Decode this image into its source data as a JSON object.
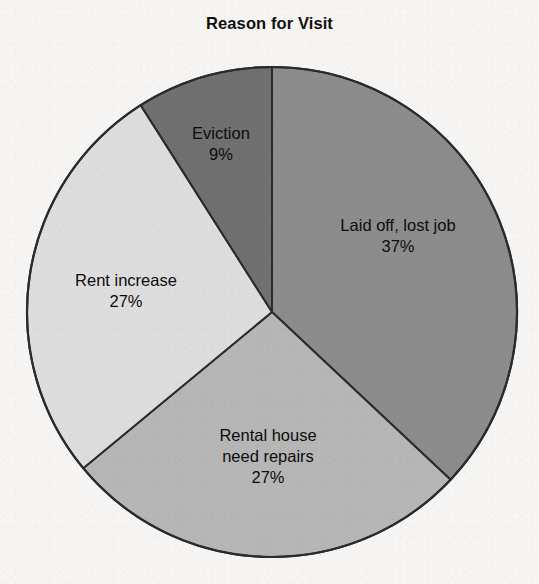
{
  "chart_data": {
    "type": "pie",
    "title": "Reason for Visit",
    "xlabel": "",
    "ylabel": "",
    "legend_position": "none",
    "grid": false,
    "labels_inside": true,
    "value_suffix": "%",
    "categories": [
      "Laid off, lost job",
      "Rental house need repairs",
      "Rent increase",
      "Eviction"
    ],
    "values": [
      37,
      27,
      27,
      9
    ],
    "start_angle_deg": 0,
    "direction": "clockwise",
    "slices": [
      {
        "name": "laid-off-lost-job",
        "label": "Laid off, lost job",
        "label_lines": [
          "Laid off, lost job"
        ],
        "value": 37,
        "value_text": "37%",
        "color": "#8c8c8c",
        "start_deg": 0,
        "end_deg": 133.2
      },
      {
        "name": "rental-house-need-repairs",
        "label": "Rental house need repairs",
        "label_lines": [
          "Rental house",
          "need repairs"
        ],
        "value": 27,
        "value_text": "27%",
        "color": "#b6b6b6",
        "start_deg": 133.2,
        "end_deg": 230.4
      },
      {
        "name": "rent-increase",
        "label": "Rent increase",
        "label_lines": [
          "Rent increase"
        ],
        "value": 27,
        "value_text": "27%",
        "color": "#dddddd",
        "start_deg": 230.4,
        "end_deg": 327.6
      },
      {
        "name": "eviction",
        "label": "Eviction",
        "label_lines": [
          "Eviction"
        ],
        "value": 9,
        "value_text": "9%",
        "color": "#707070",
        "start_deg": 327.6,
        "end_deg": 360
      }
    ],
    "geometry": {
      "center_x": 272,
      "center_y": 312,
      "radius": 245
    },
    "colors": {
      "outline": "#2b2b2b",
      "background": "#f6f5f3",
      "text": "#0c0c0c"
    }
  },
  "labels": {
    "laid_off": {
      "line1": "Laid off, lost job",
      "pct": "37%"
    },
    "rental_repairs": {
      "line1": "Rental house",
      "line2": "need repairs",
      "pct": "27%"
    },
    "rent_increase": {
      "line1": "Rent increase",
      "pct": "27%"
    },
    "eviction": {
      "line1": "Eviction",
      "pct": "9%"
    }
  }
}
